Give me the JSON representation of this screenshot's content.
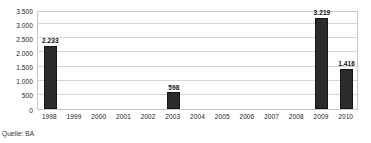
{
  "chart_data": {
    "type": "bar",
    "title": "",
    "subtitle": "",
    "xlabel": "",
    "ylabel": "",
    "categories": [
      "1998",
      "1999",
      "2000",
      "2001",
      "2002",
      "2003",
      "2004",
      "2005",
      "2006",
      "2007",
      "2008",
      "2009",
      "2010"
    ],
    "values": [
      2233,
      0,
      0,
      0,
      0,
      598,
      0,
      0,
      0,
      0,
      0,
      3219,
      1416
    ],
    "data_labels": [
      "2.233",
      "",
      "",
      "",
      "",
      "598",
      "",
      "",
      "",
      "",
      "",
      "3.219",
      "1.416"
    ],
    "ylim": [
      0,
      3500
    ],
    "y_ticks": [
      0,
      500,
      1000,
      1500,
      2000,
      2500,
      3000,
      3500
    ],
    "y_tick_labels": [
      "0",
      "500",
      "1.000",
      "1.500",
      "2.000",
      "2.500",
      "3.000",
      "3.500"
    ],
    "grid": true,
    "grid_axis": "y",
    "legend": false,
    "legend_position": "none",
    "bar_color": "#2b2b2b",
    "grid_color": "#d6d6d6",
    "plot_border_color": "#c8c8c8",
    "background_color": "#ffffff",
    "number_format": "de-DE"
  },
  "caption": {
    "source_text": "Quelle: BA"
  }
}
